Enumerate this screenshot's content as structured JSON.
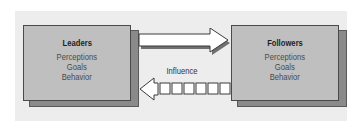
{
  "diagram": {
    "type": "leader-follower influence model",
    "nodes": [
      {
        "id": "leaders",
        "title": "Leaders",
        "attributes": [
          "Perceptions",
          "Goals",
          "Behavior"
        ]
      },
      {
        "id": "followers",
        "title": "Followers",
        "attributes": [
          "Perceptions",
          "Goals",
          "Behavior"
        ]
      }
    ],
    "edges": [
      {
        "from": "leaders",
        "to": "followers",
        "style": "solid-arrow"
      },
      {
        "from": "followers",
        "to": "leaders",
        "style": "segmented-arrow"
      }
    ],
    "edge_label": "Influence"
  },
  "colors": {
    "panel": "#ededed",
    "box_fill": "#bfbfbf",
    "box_shadow": "#8a8a8a",
    "arrow_fill": "#ffffff",
    "arrow_shadow": "#707070"
  }
}
